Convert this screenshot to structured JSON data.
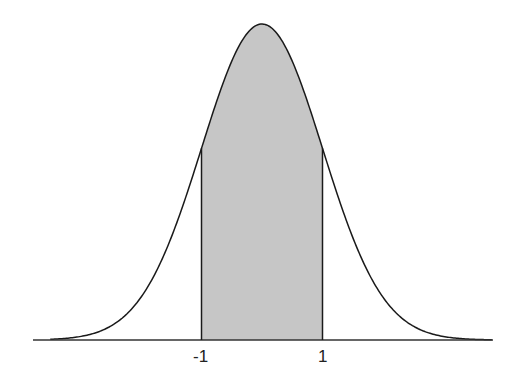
{
  "chart_data": {
    "type": "area",
    "title": "",
    "xlabel": "",
    "ylabel": "",
    "distribution": {
      "mean": 0,
      "sd": 1
    },
    "xlim": [
      -3.5,
      3.8
    ],
    "shaded_region": {
      "from": -1,
      "to": 1,
      "approx_probability": 0.6827
    },
    "tick_labels": [
      {
        "value": -1,
        "label": "-1"
      },
      {
        "value": 1,
        "label": "1"
      }
    ],
    "grid": false,
    "legend": null,
    "colors": {
      "curve": "#1a1a1a",
      "shade": "#c6c6c6",
      "axis": "#333333"
    }
  },
  "labels": {
    "neg_one": "-1",
    "pos_one": "1"
  }
}
